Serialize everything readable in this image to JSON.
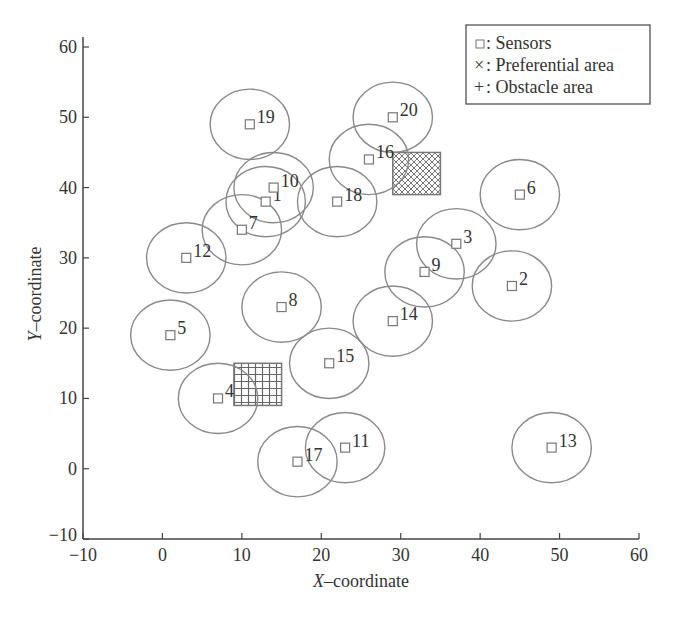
{
  "chart_data": {
    "type": "scatter",
    "title": "",
    "xlabel_italic": "X",
    "xlabel_rest": "–coordinate",
    "ylabel_italic": "Y",
    "ylabel_rest": "–coordinate",
    "xlim": [
      -10,
      60
    ],
    "ylim": [
      -10,
      60
    ],
    "grid": false,
    "xticks": [
      -10,
      0,
      10,
      20,
      30,
      40,
      50,
      60
    ],
    "yticks": [
      -10,
      0,
      10,
      20,
      30,
      40,
      50,
      60
    ],
    "xtick_labels": [
      "−10",
      "0",
      "10",
      "20",
      "30",
      "40",
      "50",
      "60"
    ],
    "ytick_labels": [
      "−10",
      "0",
      "10",
      "20",
      "30",
      "40",
      "50",
      "60"
    ],
    "sensing_radius": 5,
    "sensors": [
      {
        "id": "1",
        "x": 13,
        "y": 38
      },
      {
        "id": "2",
        "x": 44,
        "y": 26
      },
      {
        "id": "3",
        "x": 37,
        "y": 32
      },
      {
        "id": "4",
        "x": 7,
        "y": 10
      },
      {
        "id": "5",
        "x": 1,
        "y": 19
      },
      {
        "id": "6",
        "x": 45,
        "y": 39
      },
      {
        "id": "7",
        "x": 10,
        "y": 34
      },
      {
        "id": "8",
        "x": 15,
        "y": 23
      },
      {
        "id": "9",
        "x": 33,
        "y": 28
      },
      {
        "id": "10",
        "x": 14,
        "y": 40
      },
      {
        "id": "11",
        "x": 23,
        "y": 3
      },
      {
        "id": "12",
        "x": 3,
        "y": 30
      },
      {
        "id": "13",
        "x": 49,
        "y": 3
      },
      {
        "id": "14",
        "x": 29,
        "y": 21
      },
      {
        "id": "15",
        "x": 21,
        "y": 15
      },
      {
        "id": "16",
        "x": 26,
        "y": 44
      },
      {
        "id": "17",
        "x": 17,
        "y": 1
      },
      {
        "id": "18",
        "x": 22,
        "y": 38
      },
      {
        "id": "19",
        "x": 11,
        "y": 49
      },
      {
        "id": "20",
        "x": 29,
        "y": 50
      }
    ],
    "regions": [
      {
        "name": "Preferential area",
        "pattern": "cross-hatch",
        "x_range": [
          29,
          35
        ],
        "y_range": [
          39,
          45
        ]
      },
      {
        "name": "Obstacle area",
        "pattern": "grid",
        "x_range": [
          9,
          15
        ],
        "y_range": [
          9,
          15
        ]
      }
    ],
    "legend": {
      "position": "upper right",
      "entries": [
        {
          "symbol": "□",
          "label": ": Sensors"
        },
        {
          "symbol": "×",
          "label": ": Preferential area"
        },
        {
          "symbol": "+",
          "label": ": Obstacle area"
        }
      ]
    }
  },
  "style": {
    "axis_color": "#444444",
    "circle_color": "#8a8a8a",
    "marker_color": "#777777",
    "text_color": "#333333",
    "hatch_color": "#777777"
  }
}
